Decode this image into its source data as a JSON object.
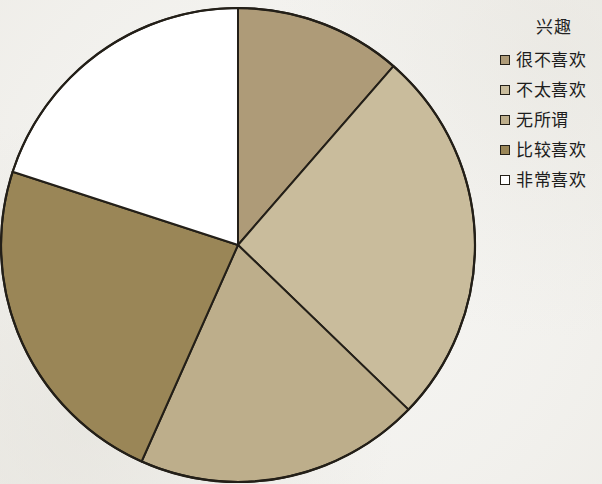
{
  "legend": {
    "title": "兴趣",
    "items": [
      {
        "label": "很不喜欢",
        "color": "#ae9b78",
        "swatch_name": "legend-swatch-hen-bu-xihuan"
      },
      {
        "label": "不太喜欢",
        "color": "#c9bc9c",
        "swatch_name": "legend-swatch-bu-tai-xihuan"
      },
      {
        "label": "无所谓",
        "color": "#bdae8b",
        "swatch_name": "legend-swatch-wu-suo-wei"
      },
      {
        "label": "比较喜欢",
        "color": "#9a8657",
        "swatch_name": "legend-swatch-bijiao-xihuan"
      },
      {
        "label": "非常喜欢",
        "color": "#ffffff",
        "swatch_name": "legend-swatch-feichang-xihuan"
      }
    ]
  },
  "chart_data": {
    "type": "pie",
    "title": "兴趣",
    "xlabel": "",
    "ylabel": "",
    "legend_position": "right",
    "grid": false,
    "start_angle_deg": 0,
    "direction": "clockwise",
    "categories": [
      "很不喜欢",
      "不太喜欢",
      "无所谓",
      "比较喜欢",
      "非常喜欢"
    ],
    "values": [
      11.4,
      25.8,
      19.4,
      23.3,
      20.0
    ],
    "angles_deg": [
      41,
      93,
      70,
      84,
      72
    ],
    "colors": [
      "#ae9b78",
      "#c9bc9c",
      "#bdae8b",
      "#9a8657",
      "#ffffff"
    ],
    "slice_border_color": "#231f18",
    "center": {
      "x": 238,
      "y": 245
    },
    "radius": 237
  }
}
